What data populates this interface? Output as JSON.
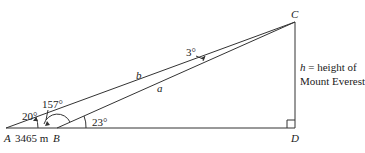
{
  "diagram": {
    "points": {
      "A": {
        "label": "A",
        "x": 6,
        "y": 128
      },
      "B": {
        "label": "B",
        "x": 57,
        "y": 128
      },
      "C": {
        "label": "C",
        "x": 295,
        "y": 22
      },
      "D": {
        "label": "D",
        "x": 295,
        "y": 128
      }
    },
    "distance_AB": "3465 m",
    "sides": {
      "a": "a",
      "b": "b"
    },
    "angles": {
      "A": "20°",
      "ABC": "157°",
      "B_ext": "23°",
      "C": "3°"
    },
    "height_label_line1": "h = height of",
    "height_label_line2": "Mount Everest",
    "colors": {
      "line": "#333333",
      "text": "#1a1a1a",
      "background": "#ffffff"
    }
  }
}
